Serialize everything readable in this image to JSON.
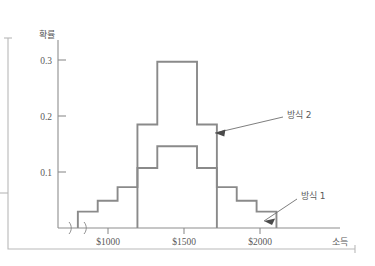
{
  "chart_data": {
    "type": "bar",
    "title": "",
    "subtitle": "",
    "xlabel": "소득",
    "ylabel": "확률",
    "xlabel_en": "income",
    "ylabel_en": "probability",
    "grid": false,
    "legend_position": "inline-annotations",
    "axis_break": true,
    "axis_break_symbol": "⟩⟩",
    "ylim": [
      0,
      0.345
    ],
    "yticks": [
      0.1,
      0.2,
      0.3
    ],
    "ytick_labels": [
      "0.1",
      "0.2",
      "0.3"
    ],
    "xticks": [
      1000,
      1500,
      2000
    ],
    "xtick_labels": [
      "$1000",
      "$1500",
      "$2000"
    ],
    "xlim": [
      900,
      2320
    ],
    "bin_width": 100,
    "bin_edges": [
      1000,
      1100,
      1200,
      1300,
      1400,
      1500,
      1600,
      1700,
      1800,
      1900,
      2000,
      2100
    ],
    "series": [
      {
        "name": "방식 1",
        "name_en": "Method 1",
        "color": "#8a8a8a",
        "values": [
          0.03,
          0.05,
          0.075,
          0.11,
          0.15,
          0.15,
          0.11,
          0.075,
          0.05,
          0.03,
          0.0
        ]
      },
      {
        "name": "방식 2",
        "name_en": "Method 2",
        "color": "#8a8a8a",
        "values": [
          0.0,
          0.0,
          0.0,
          0.19,
          0.305,
          0.305,
          0.19,
          0.0,
          0.0,
          0.0,
          0.0
        ]
      }
    ],
    "annotations": [
      {
        "label": "방식 2",
        "points_to_series": "방식 2",
        "x": 1720,
        "y": 0.175
      },
      {
        "label": "방식 1",
        "points_to_series": "방식 1",
        "x": 2020,
        "y": 0.018
      }
    ]
  },
  "axis": {
    "y_title": "확률",
    "x_title": "소득",
    "y_tick_0": "0.3",
    "y_tick_1": "0.2",
    "y_tick_2": "0.1",
    "x_tick_0": "$1000",
    "x_tick_1": "$1500",
    "x_tick_2": "$2000"
  },
  "annotations": {
    "method2": "방식 2",
    "method1": "방식 1"
  },
  "colors": {
    "histogram_stroke": "#8a8a8a",
    "axis": "#8e8e8e",
    "frame": "#b9b9b9",
    "text": "#5a5a5a",
    "arrow": "#4a4a4a",
    "background": "#ffffff"
  }
}
